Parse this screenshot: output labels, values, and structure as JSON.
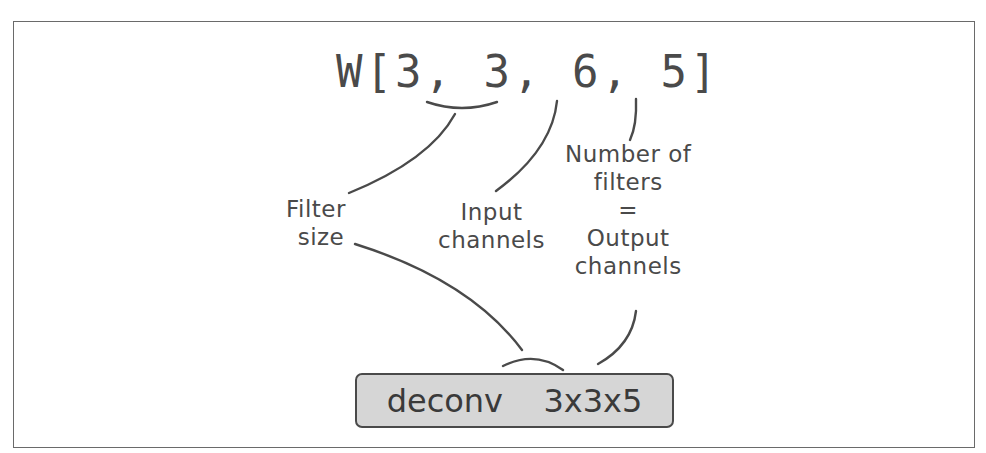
{
  "diagram": {
    "weight_expression": "W[3, 3, 6, 5]",
    "labels": {
      "filter_size": [
        "Filter",
        "size"
      ],
      "input_channels": [
        "Input",
        "channels"
      ],
      "num_filters": [
        "Number of",
        "filters",
        "=",
        "Output",
        "channels"
      ]
    },
    "layer_box": {
      "label": "deconv  3x3x5",
      "fill": "#d6d6d6",
      "border": "#4a4a4a"
    },
    "stroke_color": "#4a4a4a"
  }
}
